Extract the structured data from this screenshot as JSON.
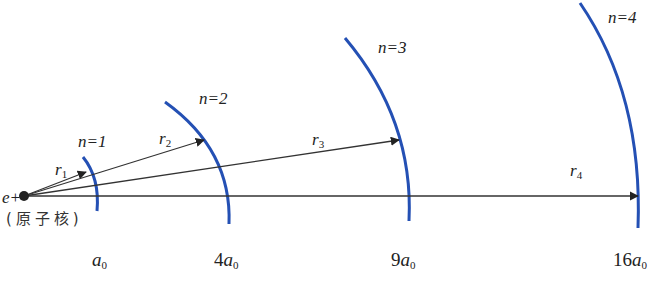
{
  "diagram": {
    "nucleus": {
      "label": "e+",
      "caption": "(原子核)"
    },
    "orbits": [
      {
        "n_label": "n=1",
        "radius_label": "r",
        "radius_sub": "1",
        "axis_coef": "",
        "axis_symbol": "a",
        "axis_sub": "0"
      },
      {
        "n_label": "n=2",
        "radius_label": "r",
        "radius_sub": "2",
        "axis_coef": "4",
        "axis_symbol": "a",
        "axis_sub": "0"
      },
      {
        "n_label": "n=3",
        "radius_label": "r",
        "radius_sub": "3",
        "axis_coef": "9",
        "axis_symbol": "a",
        "axis_sub": "0"
      },
      {
        "n_label": "n=4",
        "radius_label": "r",
        "radius_sub": "4",
        "axis_coef": "16",
        "axis_symbol": "a",
        "axis_sub": "0"
      }
    ],
    "colors": {
      "orbit": "#2450b4",
      "arrow": "#333333",
      "text": "#222222"
    }
  }
}
